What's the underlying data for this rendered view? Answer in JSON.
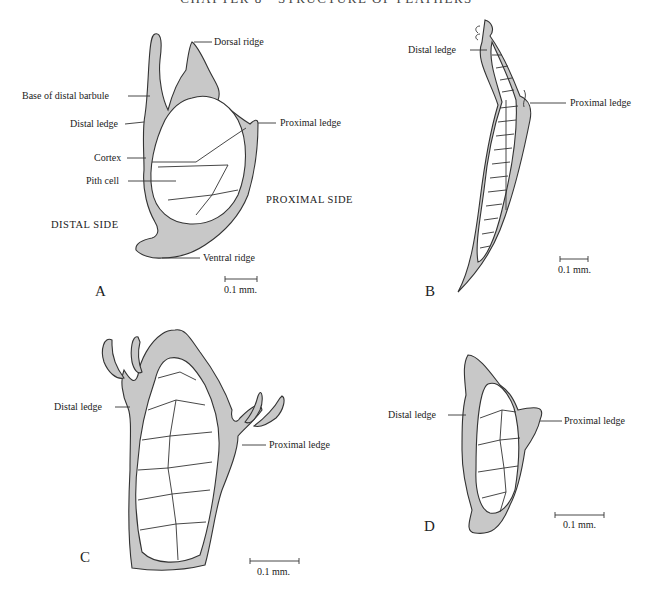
{
  "page_header": "CHAPTER 8 · STRUCTURE OF FEATHERS",
  "panels": {
    "A": {
      "letter": "A",
      "labels": {
        "dorsal_ridge": "Dorsal ridge",
        "base_distal_barbule": "Base of distal barbule",
        "distal_ledge": "Distal ledge",
        "proximal_ledge": "Proximal ledge",
        "cortex": "Cortex",
        "pith_cell": "Pith cell",
        "proximal_side": "PROXIMAL SIDE",
        "distal_side": "DISTAL SIDE",
        "ventral_ridge": "Ventral ridge"
      },
      "scale": "0.1 mm."
    },
    "B": {
      "letter": "B",
      "labels": {
        "distal_ledge": "Distal ledge",
        "proximal_ledge": "Proximal ledge"
      },
      "scale": "0.1 mm."
    },
    "C": {
      "letter": "C",
      "labels": {
        "distal_ledge": "Distal ledge",
        "proximal_ledge": "Proximal ledge"
      },
      "scale": "0.1 mm."
    },
    "D": {
      "letter": "D",
      "labels": {
        "distal_ledge": "Distal ledge",
        "proximal_ledge": "Proximal ledge"
      },
      "scale": "0.1 mm."
    }
  }
}
